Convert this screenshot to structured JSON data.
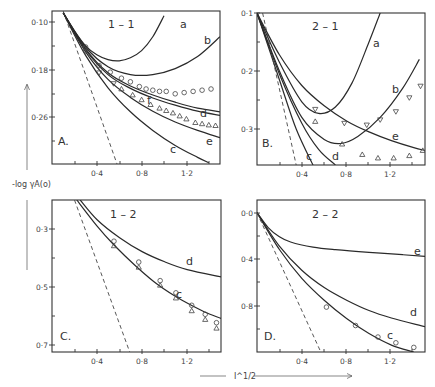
{
  "figure": {
    "y_axis_title": "-log γA(o)",
    "x_axis_title": "I^1/2"
  },
  "chart_data": [
    {
      "type": "line",
      "panel": "A.",
      "title": "1-1",
      "xlabel": "I^1/2",
      "ylabel": "-log γA(o)",
      "xlim": [
        0,
        1.5
      ],
      "ylim": [
        0.082,
        0.337
      ],
      "y_inverted": true,
      "x_ticks": [
        "0·4",
        "0·8",
        "1·2"
      ],
      "y_ticks": [
        "0·10",
        "0·18",
        "0·26"
      ],
      "series": [
        {
          "name": "a",
          "style": "solid",
          "x": [
            0.1,
            0.2,
            0.3,
            0.4,
            0.5,
            0.6,
            0.7,
            0.8,
            0.9,
            1.0
          ],
          "y": [
            0.085,
            0.115,
            0.14,
            0.155,
            0.163,
            0.165,
            0.16,
            0.148,
            0.125,
            0.09
          ]
        },
        {
          "name": "b",
          "style": "solid",
          "x": [
            0.1,
            0.3,
            0.5,
            0.7,
            0.9,
            1.1,
            1.3,
            1.5
          ],
          "y": [
            0.085,
            0.142,
            0.175,
            0.188,
            0.188,
            0.178,
            0.158,
            0.125
          ]
        },
        {
          "name": "f",
          "style": "solid",
          "x": [
            0.1,
            0.3,
            0.5,
            0.7,
            0.9,
            1.1,
            1.3,
            1.5
          ],
          "y": [
            0.085,
            0.145,
            0.185,
            0.207,
            0.222,
            0.234,
            0.244,
            0.25
          ]
        },
        {
          "name": "d",
          "style": "solid",
          "x": [
            0.1,
            0.3,
            0.5,
            0.7,
            0.9,
            1.1,
            1.3,
            1.5
          ],
          "y": [
            0.085,
            0.147,
            0.188,
            0.211,
            0.227,
            0.239,
            0.249,
            0.256
          ]
        },
        {
          "name": "e",
          "style": "solid",
          "x": [
            0.1,
            0.3,
            0.5,
            0.7,
            0.9,
            1.1,
            1.3,
            1.5
          ],
          "y": [
            0.085,
            0.15,
            0.196,
            0.226,
            0.249,
            0.267,
            0.281,
            0.293
          ]
        },
        {
          "name": "c",
          "style": "solid",
          "x": [
            0.1,
            0.3,
            0.5,
            0.7,
            0.9,
            1.1,
            1.3,
            1.4
          ],
          "y": [
            0.085,
            0.156,
            0.21,
            0.25,
            0.281,
            0.306,
            0.326,
            0.335
          ]
        },
        {
          "name": "limiting law",
          "style": "dashed",
          "x": [
            0.1,
            0.58
          ],
          "y": [
            0.082,
            0.337
          ]
        }
      ],
      "points": [
        {
          "marker": "circle",
          "x": [
            0.3,
            0.42,
            0.52,
            0.62,
            0.7,
            0.78,
            0.84,
            0.9,
            0.96,
            1.02,
            1.1,
            1.18,
            1.26,
            1.34,
            1.42
          ],
          "y": [
            0.142,
            0.173,
            0.184,
            0.194,
            0.2,
            0.208,
            0.212,
            0.214,
            0.216,
            0.216,
            0.22,
            0.218,
            0.216,
            0.214,
            0.212
          ]
        },
        {
          "marker": "triangle-down",
          "x": [
            0.3,
            0.42,
            0.55
          ],
          "y": [
            0.15,
            0.185,
            0.203
          ]
        },
        {
          "marker": "triangle-up",
          "x": [
            0.62,
            0.72,
            0.8,
            0.88,
            0.96,
            1.02,
            1.08,
            1.14,
            1.2,
            1.28,
            1.34,
            1.4,
            1.46
          ],
          "y": [
            0.212,
            0.222,
            0.23,
            0.238,
            0.244,
            0.248,
            0.252,
            0.257,
            0.262,
            0.268,
            0.27,
            0.272,
            0.273
          ]
        }
      ]
    },
    {
      "type": "line",
      "panel": "B.",
      "title": "2-1",
      "xlabel": "I^1/2",
      "ylabel": "-log γA(o)",
      "xlim": [
        0,
        1.5
      ],
      "ylim": [
        0.1,
        0.362
      ],
      "y_inverted": true,
      "x_ticks": [
        "0·4",
        "0·8",
        "1·2"
      ],
      "y_ticks": [
        "0·1",
        "0·2",
        "0·3"
      ],
      "series": [
        {
          "name": "a",
          "style": "solid",
          "x": [
            0.0,
            0.2,
            0.4,
            0.55,
            0.7,
            0.85,
            1.0,
            1.1
          ],
          "y": [
            0.1,
            0.185,
            0.253,
            0.273,
            0.262,
            0.22,
            0.15,
            0.1
          ]
        },
        {
          "name": "b",
          "style": "solid",
          "x": [
            0.0,
            0.2,
            0.4,
            0.6,
            0.75,
            0.9,
            1.1,
            1.3,
            1.45
          ],
          "y": [
            0.1,
            0.2,
            0.28,
            0.318,
            0.325,
            0.313,
            0.28,
            0.23,
            0.18
          ]
        },
        {
          "name": "e",
          "style": "solid",
          "x": [
            0.0,
            0.2,
            0.4,
            0.6,
            0.8,
            1.0,
            1.2,
            1.4,
            1.5
          ],
          "y": [
            0.1,
            0.172,
            0.225,
            0.26,
            0.286,
            0.305,
            0.32,
            0.332,
            0.337
          ]
        },
        {
          "name": "d",
          "style": "solid",
          "x": [
            0.0,
            0.2,
            0.4,
            0.55,
            0.7
          ],
          "y": [
            0.1,
            0.205,
            0.29,
            0.335,
            0.362
          ]
        },
        {
          "name": "c",
          "style": "solid",
          "x": [
            0.0,
            0.2,
            0.35,
            0.5
          ],
          "y": [
            0.1,
            0.215,
            0.3,
            0.362
          ]
        },
        {
          "name": "limiting law",
          "style": "dashed",
          "x": [
            0.05,
            0.35
          ],
          "y": [
            0.1,
            0.362
          ]
        }
      ],
      "points": [
        {
          "marker": "triangle-down",
          "x": [
            0.52,
            0.78,
            0.98,
            1.1,
            1.24,
            1.36,
            1.46
          ],
          "y": [
            0.266,
            0.29,
            0.293,
            0.284,
            0.27,
            0.246,
            0.226
          ]
        },
        {
          "marker": "triangle-up",
          "x": [
            0.52,
            0.76,
            0.94,
            1.08,
            1.22,
            1.36,
            1.48
          ],
          "y": [
            0.287,
            0.326,
            0.344,
            0.35,
            0.35,
            0.346,
            0.337
          ]
        }
      ]
    },
    {
      "type": "line",
      "panel": "C.",
      "title": "1-2",
      "xlabel": "I^1/2",
      "ylabel": "-log γA(o)",
      "xlim": [
        0,
        1.5
      ],
      "ylim": [
        0.2,
        0.724
      ],
      "y_inverted": true,
      "x_ticks": [
        "0·4",
        "0·8",
        "1·2"
      ],
      "y_ticks": [
        "0·3",
        "0·5",
        "0·7"
      ],
      "series": [
        {
          "name": "d",
          "style": "solid",
          "x": [
            0.25,
            0.4,
            0.6,
            0.8,
            1.0,
            1.2,
            1.5
          ],
          "y": [
            0.2,
            0.268,
            0.33,
            0.378,
            0.413,
            0.44,
            0.465
          ]
        },
        {
          "name": "c",
          "style": "solid",
          "x": [
            0.22,
            0.4,
            0.55,
            0.75,
            0.95,
            1.15,
            1.35,
            1.5
          ],
          "y": [
            0.2,
            0.29,
            0.355,
            0.43,
            0.495,
            0.545,
            0.585,
            0.608
          ]
        },
        {
          "name": "limiting law",
          "style": "dashed",
          "x": [
            0.2,
            0.69
          ],
          "y": [
            0.2,
            0.724
          ]
        }
      ],
      "points": [
        {
          "marker": "circle",
          "x": [
            0.55,
            0.77,
            0.96,
            1.1,
            1.24,
            1.36,
            1.46
          ],
          "y": [
            0.342,
            0.414,
            0.478,
            0.52,
            0.563,
            0.594,
            0.623
          ]
        },
        {
          "marker": "triangle-up",
          "x": [
            0.55,
            0.77,
            0.96,
            1.1,
            1.24,
            1.36,
            1.46
          ],
          "y": [
            0.358,
            0.432,
            0.494,
            0.538,
            0.582,
            0.612,
            0.642
          ]
        }
      ]
    },
    {
      "type": "line",
      "panel": "D.",
      "title": "2-2",
      "xlabel": "I^1/2",
      "ylabel": "-log γA(o)",
      "xlim": [
        0,
        1.5
      ],
      "ylim": [
        -0.11,
        1.21
      ],
      "y_inverted": true,
      "x_ticks": [
        "0·4",
        "0·8",
        "1·2"
      ],
      "y_ticks": [
        "0·0",
        "0·4",
        "0·8"
      ],
      "series": [
        {
          "name": "e",
          "style": "solid",
          "x": [
            0.0,
            0.1,
            0.2,
            0.3,
            0.5,
            0.7,
            1.0,
            1.3,
            1.5
          ],
          "y": [
            0.0,
            0.13,
            0.21,
            0.255,
            0.3,
            0.322,
            0.345,
            0.365,
            0.38
          ]
        },
        {
          "name": "d",
          "style": "solid",
          "x": [
            0.0,
            0.2,
            0.4,
            0.6,
            0.8,
            1.0,
            1.2,
            1.5
          ],
          "y": [
            0.0,
            0.29,
            0.5,
            0.65,
            0.76,
            0.85,
            0.915,
            0.99
          ]
        },
        {
          "name": "c",
          "style": "solid",
          "x": [
            0.0,
            0.2,
            0.4,
            0.6,
            0.8,
            1.0,
            1.2,
            1.4
          ],
          "y": [
            0.0,
            0.32,
            0.57,
            0.76,
            0.92,
            1.05,
            1.15,
            1.21
          ]
        },
        {
          "name": "limiting law",
          "style": "dashed",
          "x": [
            0.0,
            0.57
          ],
          "y": [
            0.0,
            1.21
          ]
        }
      ],
      "points": [
        {
          "marker": "circle",
          "x": [
            0.62,
            0.88,
            1.08,
            1.24,
            1.4
          ],
          "y": [
            0.82,
            0.98,
            1.08,
            1.13,
            1.17
          ]
        }
      ]
    }
  ]
}
